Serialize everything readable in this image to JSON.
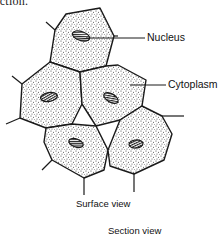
{
  "figure": {
    "type": "epithelial cells illustration",
    "top_caption": "ection.",
    "labels": {
      "nucleus": "Nucleus",
      "cytoplasm": "Cytoplasm",
      "surface_view": "Surface view",
      "section_view": "Section view"
    },
    "cell_count": 5,
    "colors": {
      "outline": "#1a1a1a",
      "stipple": "#333333",
      "background": "#ffffff"
    }
  }
}
